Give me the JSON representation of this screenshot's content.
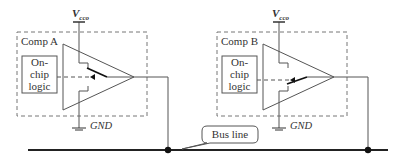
{
  "diagram": {
    "type": "circuit",
    "components": [
      {
        "label": "Comp A",
        "logic_label_lines": [
          "On-",
          "chip",
          "logic"
        ],
        "supply": {
          "main": "V",
          "sub": "cco"
        },
        "ground": "GND"
      },
      {
        "label": "Comp B",
        "logic_label_lines": [
          "On-",
          "chip",
          "logic"
        ],
        "supply": {
          "main": "V",
          "sub": "cco"
        },
        "ground": "GND"
      }
    ],
    "bus": {
      "label": "Bus line"
    },
    "colors": {
      "line": "#555555",
      "bus": "#222222",
      "dashed": "#777777"
    }
  }
}
